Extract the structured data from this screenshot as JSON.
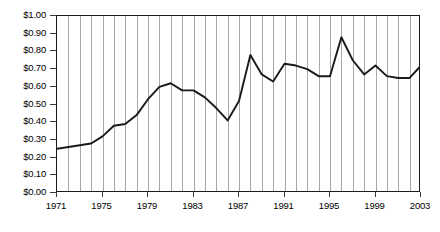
{
  "chart_data": {
    "type": "line",
    "title": "",
    "subtitle": "",
    "xlabel": "",
    "ylabel": "",
    "grid": "vertical-only",
    "legend": "none",
    "xlim": [
      1971,
      2003
    ],
    "ylim": [
      0.0,
      1.0
    ],
    "y_tick_step": 0.1,
    "y_tick_labels": [
      "$1.00",
      "$0.90",
      "$0.80",
      "$0.70",
      "$0.60",
      "$0.50",
      "$0.40",
      "$0.30",
      "$0.20",
      "$0.10",
      "$0.00"
    ],
    "y_tick_values": [
      1.0,
      0.9,
      0.8,
      0.7,
      0.6,
      0.5,
      0.4,
      0.3,
      0.2,
      0.1,
      0.0
    ],
    "x_tick_labels": [
      "1971",
      "1975",
      "1979",
      "1983",
      "1987",
      "1991",
      "1995",
      "1999",
      "2003"
    ],
    "x_tick_values": [
      1971,
      1975,
      1979,
      1983,
      1987,
      1991,
      1995,
      1999,
      2003
    ],
    "x": [
      1971,
      1972,
      1973,
      1974,
      1975,
      1976,
      1977,
      1978,
      1979,
      1980,
      1981,
      1982,
      1983,
      1984,
      1985,
      1986,
      1987,
      1988,
      1989,
      1990,
      1991,
      1992,
      1993,
      1994,
      1995,
      1996,
      1997,
      1998,
      1999,
      2000,
      2001,
      2002,
      2003
    ],
    "values": [
      0.25,
      0.26,
      0.27,
      0.28,
      0.32,
      0.38,
      0.39,
      0.44,
      0.53,
      0.6,
      0.62,
      0.58,
      0.58,
      0.54,
      0.48,
      0.41,
      0.52,
      0.78,
      0.67,
      0.63,
      0.73,
      0.72,
      0.7,
      0.66,
      0.66,
      0.88,
      0.75,
      0.67,
      0.72,
      0.66,
      0.65,
      0.65,
      0.72
    ],
    "series": [
      {
        "name": "price",
        "color": "#1a1a1a",
        "values": [
          0.25,
          0.26,
          0.27,
          0.28,
          0.32,
          0.38,
          0.39,
          0.44,
          0.53,
          0.6,
          0.62,
          0.58,
          0.58,
          0.54,
          0.48,
          0.41,
          0.52,
          0.78,
          0.67,
          0.63,
          0.73,
          0.72,
          0.7,
          0.66,
          0.66,
          0.88,
          0.75,
          0.67,
          0.72,
          0.66,
          0.65,
          0.65,
          0.72
        ]
      }
    ],
    "colors": {
      "line": "#1a1a1a",
      "grid": "#a8a8a8",
      "frame": "#1a1a1a",
      "background": "#ffffff",
      "text": "#000000"
    }
  }
}
